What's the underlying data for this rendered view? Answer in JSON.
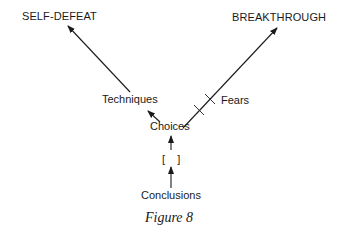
{
  "figure": {
    "caption": "Figure 8",
    "nodes": {
      "self_defeat": "SELF-DEFEAT",
      "breakthrough": "BREAKTHROUGH",
      "techniques": "Techniques",
      "fears": "Fears",
      "choices": "Choices",
      "blank": "[    ]",
      "conclusions": "Conclusions"
    },
    "edges": [
      {
        "from": "Conclusions",
        "to": "[ ]",
        "type": "arrow"
      },
      {
        "from": "[ ]",
        "to": "Choices",
        "type": "arrow"
      },
      {
        "from": "Choices",
        "to": "Techniques",
        "type": "arrow"
      },
      {
        "from": "Techniques",
        "to": "SELF-DEFEAT",
        "type": "arrow"
      },
      {
        "from": "Choices",
        "to": "BREAKTHROUGH",
        "type": "arrow blocked by Fears barrier"
      }
    ],
    "colors": {
      "ink": "#1a1a1a",
      "background": "#ffffff"
    }
  }
}
